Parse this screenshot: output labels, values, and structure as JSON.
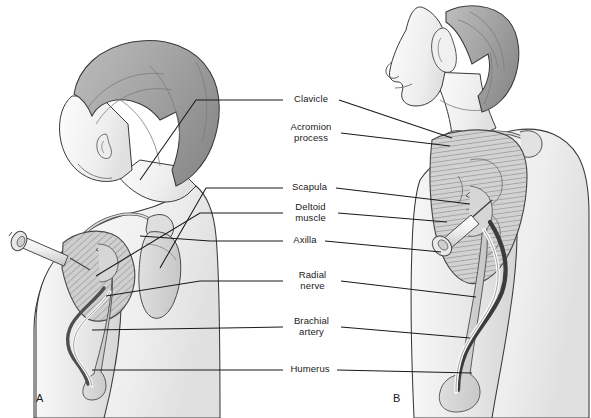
{
  "figure": {
    "background_color": "#ffffff",
    "line_color": "#1a1a1a",
    "skin_fill": "#f2f2f2",
    "muscle_fill": "#c9c9c9",
    "bone_fill": "#d8d8d8",
    "hair_fill": "#9a9a9a",
    "artery_color": "#3a3a3a",
    "nerve_color": "#ffffff"
  },
  "panels": [
    {
      "id": "A",
      "label": "A",
      "caption": "Child (infant) left shoulder, posterior-lateral view with syringe in deltoid"
    },
    {
      "id": "B",
      "label": "B",
      "caption": "Adult left shoulder, lateral view with syringe in deltoid"
    }
  ],
  "labels": [
    {
      "id": "clavicle",
      "text": "Clavicle",
      "lines": [
        "Clavicle"
      ]
    },
    {
      "id": "acromion",
      "text": "Acromion process",
      "lines": [
        "Acromion",
        "process"
      ]
    },
    {
      "id": "scapula",
      "text": "Scapula",
      "lines": [
        "Scapula"
      ]
    },
    {
      "id": "deltoid",
      "text": "Deltoid muscle",
      "lines": [
        "Deltoid",
        "muscle"
      ]
    },
    {
      "id": "axilla",
      "text": "Axilla",
      "lines": [
        "Axilla"
      ]
    },
    {
      "id": "radial_nerve",
      "text": "Radial nerve",
      "lines": [
        "Radial",
        "nerve"
      ]
    },
    {
      "id": "brachial_artery",
      "text": "Brachial artery",
      "lines": [
        "Brachial",
        "artery"
      ]
    },
    {
      "id": "humerus",
      "text": "Humerus",
      "lines": [
        "Humerus"
      ]
    }
  ],
  "structures": [
    "syringe",
    "needle",
    "plunger-flange",
    "deltoid-muscle",
    "clavicle-bone",
    "acromion-process",
    "scapula-bone",
    "humerus-bone",
    "brachial-artery",
    "radial-nerve",
    "axilla-region",
    "head",
    "hair",
    "ear",
    "neck",
    "torso",
    "arm"
  ]
}
